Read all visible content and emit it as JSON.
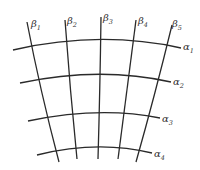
{
  "diagram": {
    "stroke_color": "#2a2a2a",
    "label_color": "#333333",
    "alpha_curves": [
      {
        "name": "α",
        "sub": "1",
        "d": "M13,50 Q100,30 181,48",
        "label_x": 183,
        "label_y": 50
      },
      {
        "name": "α",
        "sub": "2",
        "d": "M20,83 Q100,66 171,82",
        "label_x": 173,
        "label_y": 85
      },
      {
        "name": "α",
        "sub": "3",
        "d": "M28,121 Q100,106 160,118",
        "label_x": 162,
        "label_y": 122
      },
      {
        "name": "α",
        "sub": "4",
        "d": "M37,155 Q98,140 152,153",
        "label_x": 154,
        "label_y": 157
      }
    ],
    "beta_curves": [
      {
        "name": "β",
        "sub": "1",
        "d": "M27,22 Q40,90 59,162",
        "label_x": 31,
        "label_y": 27
      },
      {
        "name": "β",
        "sub": "2",
        "d": "M65,20 Q70,90 77,159",
        "label_x": 67,
        "label_y": 24
      },
      {
        "name": "β",
        "sub": "3",
        "d": "M101,17 Q100,90 98,159",
        "label_x": 103,
        "label_y": 21
      },
      {
        "name": "β",
        "sub": "4",
        "d": "M136,20 Q127,90 118,159",
        "label_x": 138,
        "label_y": 24
      },
      {
        "name": "β",
        "sub": "5",
        "d": "M172,25 Q155,95 136,162",
        "label_x": 172,
        "label_y": 27
      }
    ]
  }
}
